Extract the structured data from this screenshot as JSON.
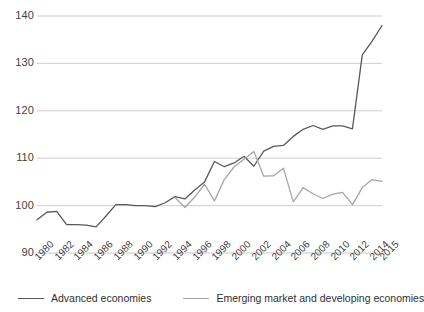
{
  "chart_data": {
    "type": "line",
    "title": "",
    "subtitle": "",
    "xlabel": "",
    "ylabel": "",
    "ylim": [
      90,
      140
    ],
    "xlim": [
      1980,
      2015
    ],
    "yticks": [
      90,
      100,
      110,
      120,
      130,
      140
    ],
    "xticks": [
      "1980",
      "1982",
      "1984",
      "1986",
      "1988",
      "1990",
      "1992",
      "1994",
      "1996",
      "1998",
      "2000",
      "2002",
      "2004",
      "2006",
      "2008",
      "2010",
      "2012",
      "2014",
      "2015"
    ],
    "grid": true,
    "legend_position": "bottom",
    "x": [
      1980,
      1981,
      1982,
      1983,
      1984,
      1985,
      1986,
      1987,
      1988,
      1989,
      1990,
      1991,
      1992,
      1993,
      1994,
      1995,
      1996,
      1997,
      1998,
      1999,
      2000,
      2001,
      2002,
      2003,
      2004,
      2005,
      2006,
      2007,
      2008,
      2009,
      2010,
      2011,
      2012,
      2013,
      2014,
      2015
    ],
    "series": [
      {
        "name": "Advanced economies",
        "color": "#595959",
        "values": [
          97.0,
          98.6,
          98.8,
          96.0,
          96.0,
          95.9,
          95.5,
          97.8,
          100.2,
          100.2,
          100.0,
          100.0,
          99.8,
          100.6,
          101.9,
          101.4,
          103.3,
          105.0,
          109.3,
          108.2,
          109.0,
          110.4,
          108.3,
          111.5,
          112.5,
          112.7,
          114.6,
          116.1,
          116.9,
          116.1,
          116.8,
          116.8,
          116.2,
          131.8,
          134.7,
          138.0
        ]
      },
      {
        "name": "Emerging market and developing economies",
        "color": "#a6a6a6",
        "values": [
          null,
          null,
          null,
          null,
          null,
          null,
          null,
          null,
          null,
          null,
          null,
          null,
          null,
          null,
          101.7,
          99.6,
          101.8,
          104.5,
          101.0,
          105.5,
          108.2,
          109.8,
          111.4,
          106.2,
          106.3,
          107.9,
          100.8,
          103.8,
          102.5,
          101.5,
          102.4,
          102.8,
          100.2,
          103.8,
          105.5,
          105.1
        ]
      }
    ]
  },
  "legend": {
    "entries": [
      {
        "label": "Advanced economies",
        "color": "#595959"
      },
      {
        "label": "Emerging market and developing economies",
        "color": "#a6a6a6"
      }
    ]
  },
  "colors": {
    "advanced": "#595959",
    "emerging": "#a6a6a6",
    "grid": "#c8c8c8",
    "text": "#3f3f3f",
    "background": "#ffffff"
  }
}
